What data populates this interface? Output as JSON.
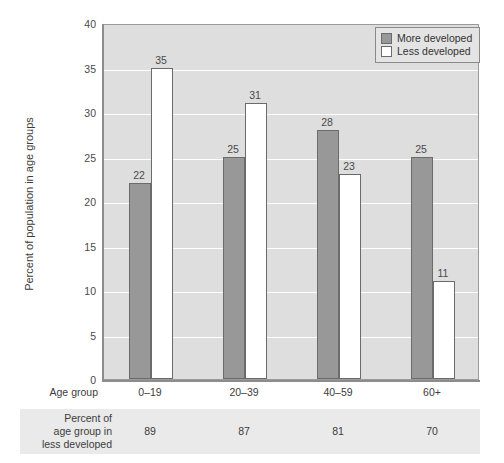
{
  "chart_data": {
    "type": "bar",
    "title": "",
    "xlabel": "Age group",
    "ylabel": "Percent of population in age groups",
    "categories": [
      "0–19",
      "20–39",
      "40–59",
      "60+"
    ],
    "series": [
      {
        "name": "More developed",
        "color": "#989898",
        "values": [
          22,
          25,
          28,
          25
        ]
      },
      {
        "name": "Less developed",
        "color": "#ffffff",
        "values": [
          35,
          31,
          23,
          11
        ]
      }
    ],
    "ylim": [
      0,
      40
    ],
    "yticks": [
      0,
      5,
      10,
      15,
      20,
      25,
      30,
      35,
      40
    ],
    "ytick_labels": [
      "0",
      "5",
      "10",
      "15",
      "20",
      "25",
      "30",
      "35",
      "40"
    ],
    "grid": "horizontal-white",
    "legend_position": "top-right",
    "plot_background": "#dedede"
  },
  "legend": {
    "items": [
      {
        "label": "More developed",
        "swatch": "more"
      },
      {
        "label": "Less developed",
        "swatch": "less"
      }
    ]
  },
  "bottom_table": {
    "row_label": "Percent of\nage group in\nless developed",
    "row_label_lines": [
      "Percent of",
      "age group in",
      "less developed"
    ],
    "values": [
      "89",
      "87",
      "81",
      "70"
    ]
  }
}
